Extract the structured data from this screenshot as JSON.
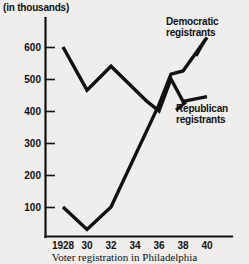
{
  "chart_data": {
    "type": "line",
    "title": "",
    "caption": "Voter registration in Philadelphia",
    "unit_note": "(in thousands)",
    "xlabel": "",
    "ylabel": "",
    "grid": false,
    "legend_position": "inline-annotations",
    "x": [
      1928,
      1930,
      1932,
      1934,
      1936,
      1937,
      1938,
      1940
    ],
    "xtick_labels": [
      "1928",
      "30",
      "32",
      "34",
      "36",
      "38",
      "40"
    ],
    "xtick_values": [
      1928,
      1930,
      1932,
      1934,
      1936,
      1938,
      1940
    ],
    "ytick_labels": [
      "100",
      "200",
      "300",
      "400",
      "500",
      "600"
    ],
    "ytick_values": [
      100,
      200,
      300,
      400,
      500,
      600
    ],
    "xlim": [
      1927,
      1941
    ],
    "ylim": [
      0,
      660
    ],
    "series": [
      {
        "name": "Republican registrants",
        "x": [
          1928,
          1930,
          1932,
          1935,
          1936,
          1937,
          1938,
          1940
        ],
        "values": [
          600,
          465,
          540,
          430,
          400,
          500,
          430,
          445
        ]
      },
      {
        "name": "Democratic registrants",
        "x": [
          1928,
          1930,
          1932,
          1936,
          1937,
          1938,
          1940
        ],
        "values": [
          100,
          30,
          100,
          420,
          515,
          525,
          630
        ]
      }
    ],
    "annotations": [
      {
        "text": "Democratic registrants",
        "for": "Democratic registrants"
      },
      {
        "text": "Republican registrants",
        "for": "Republican registrants"
      }
    ],
    "colors": {
      "line": "#111111",
      "background": "#efeeec",
      "axis": "#111111"
    }
  },
  "labels": {
    "unit_note": "(in thousands)",
    "democratic_line1": "Democratic",
    "democratic_line2": "registrants",
    "republican_line1": "Republican",
    "republican_line2": "registrants",
    "caption": "Voter registration in Philadelphia"
  }
}
